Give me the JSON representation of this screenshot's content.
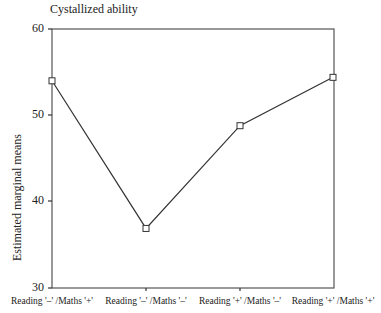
{
  "chart_data": {
    "type": "line",
    "title": "Cystallized ability",
    "xlabel": "",
    "ylabel": "Estimated marginal means",
    "categories": [
      "Reading '–' /Maths '+'",
      "Reading '–' /Maths '–'",
      "Reading '+' /Maths '–'",
      "Reading '+' /Maths '+'"
    ],
    "values": [
      54.0,
      36.9,
      48.8,
      54.4
    ],
    "ylim": [
      30,
      60
    ],
    "yticks": [
      "60",
      "50",
      "40",
      "30"
    ],
    "grid": false,
    "marker": "square",
    "line_color": "#333333"
  }
}
